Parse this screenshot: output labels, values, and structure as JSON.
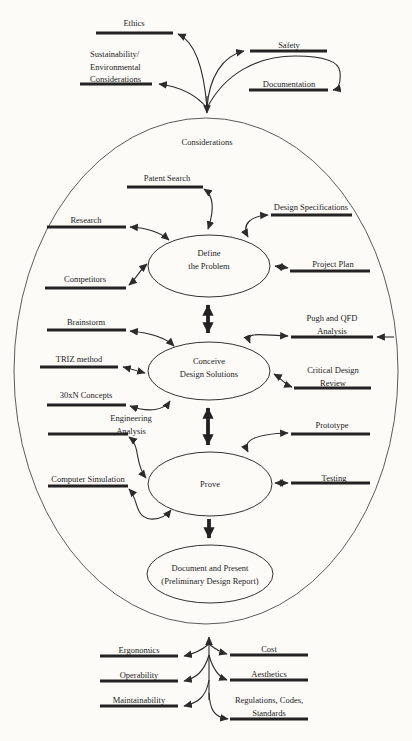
{
  "diagram_title": "Engineering design process diagram",
  "colors": {
    "background": "#fcfbf8",
    "line": "#2b2b2b",
    "bar": "#232323",
    "text": "#1d1d1d",
    "big_ellipse_stroke": "#4a4a4a"
  },
  "main_ellipse": {
    "label": "Considerations"
  },
  "stages": {
    "define": {
      "lines": [
        "Define",
        "the Problem"
      ]
    },
    "conceive": {
      "lines": [
        "Conceive",
        "Design Solutions"
      ]
    },
    "prove": {
      "lines": [
        "Prove"
      ]
    },
    "document": {
      "lines": [
        "Document and Present",
        "(Preliminary Design Report)"
      ]
    }
  },
  "labels": {
    "ethics": "Ethics",
    "safety": "Safety",
    "sustainability": [
      "Sustainability/",
      "Environmental",
      "Considerations"
    ],
    "documentation": "Documentation",
    "patent_search": "Patent Search",
    "design_specifications": "Design Specifications",
    "research": "Research",
    "project_plan": "Project Plan",
    "competitors": "Competitors",
    "brainstorm": "Brainstorm",
    "pugh_qfd": [
      "Pugh and QFD",
      "Analysis"
    ],
    "triz": "TRIZ method",
    "critical_design": [
      "Critical Design",
      "Review"
    ],
    "concepts_30xn": "30xN Concepts",
    "engineering_analysis": [
      "Engineering",
      "Analysis"
    ],
    "prototype": "Prototype",
    "computer_simulation": "Computer Simulation",
    "testing": "Testing",
    "ergonomics": "Ergonomics",
    "cost": "Cost",
    "operability": "Operability",
    "aesthetics": "Aesthetics",
    "maintainability": "Maintainability",
    "regulations": [
      "Regulations, Codes,",
      "Standards"
    ]
  }
}
